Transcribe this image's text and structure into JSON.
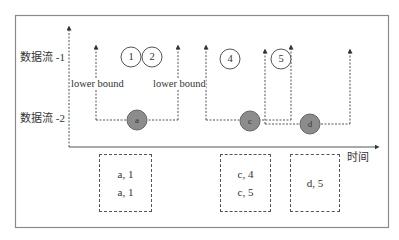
{
  "diagram": {
    "row_labels": [
      "数据流 -1",
      "数据流 -2"
    ],
    "time_axis_label": "时间",
    "lower_bound_labels": [
      "lower bound",
      "lower bound"
    ],
    "stream1_events": [
      {
        "label": "1",
        "style": "hollow"
      },
      {
        "label": "2",
        "style": "hollow"
      },
      {
        "label": "4",
        "style": "hollow"
      },
      {
        "label": "5",
        "style": "hollow"
      }
    ],
    "stream2_events": [
      {
        "label": "a",
        "style": "filled"
      },
      {
        "label": "c",
        "style": "filled"
      },
      {
        "label": "d",
        "style": "filled"
      }
    ],
    "windows": [
      {
        "anchor": "a"
      },
      {
        "anchor": "c"
      },
      {
        "anchor": "d"
      }
    ],
    "output_boxes": [
      {
        "lines": [
          "a, 1",
          "a, 1"
        ]
      },
      {
        "lines": [
          "c, 4",
          "c, 5"
        ]
      },
      {
        "lines": [
          "d, 5"
        ]
      }
    ],
    "colors": {
      "frame": "#8a8a8a",
      "line": "#444444",
      "filled_event": "#8c8c8c",
      "hollow_event": "#ffffff"
    }
  }
}
